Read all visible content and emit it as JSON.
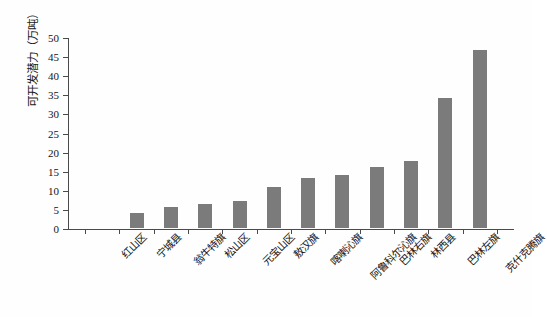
{
  "chart_data": {
    "type": "bar",
    "title": "",
    "xlabel": "",
    "ylabel": "可开发潜力（万吨）",
    "ylim": [
      0,
      50
    ],
    "yticks": [
      0,
      5,
      10,
      15,
      20,
      25,
      30,
      35,
      40,
      45,
      50
    ],
    "ytick_labels": [
      "0",
      "5",
      "10",
      "15",
      "20",
      "25",
      "30",
      "35",
      "40",
      "45",
      "50"
    ],
    "grid": false,
    "legend": null,
    "bar_color": "#7b7b7b",
    "axis_color": "#4a4a4a",
    "categories": [
      "红山区",
      "宁城县",
      "翁牛特旗",
      "松山区",
      "元宝山区",
      "敖汉旗",
      "喀喇沁旗",
      "阿鲁科尔沁旗",
      "巴林右旗",
      "林西县",
      "巴林左旗",
      "克什克腾旗"
    ],
    "values": [
      0,
      4,
      5.6,
      6.2,
      7.1,
      10.8,
      13.0,
      13.8,
      16.0,
      17.6,
      34.0,
      46.5
    ]
  }
}
